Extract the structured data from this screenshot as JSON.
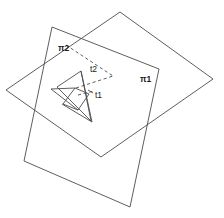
{
  "figure": {
    "background_color": "#ffffff",
    "stroke_color": "#4c4c4c",
    "label_color": "#1a1a1a",
    "width": 224,
    "height": 218,
    "labels": {
      "plane1": "π1",
      "plane2": "π2",
      "triangle1": "t1",
      "triangle2": "t2"
    },
    "label_positions": {
      "plane1": {
        "x": 142,
        "y": 79
      },
      "plane2": {
        "x": 58,
        "y": 48
      },
      "triangle1": {
        "x": 95,
        "y": 95
      },
      "triangle2": {
        "x": 92,
        "y": 70
      }
    },
    "shapes": {
      "plane1": {
        "name": "plane-pi1",
        "kind": "quadrilateral",
        "style": "solid",
        "points": "120,12 213,79 101,157 6,90"
      },
      "plane2": {
        "name": "plane-pi2",
        "kind": "quadrilateral",
        "style": "solid",
        "points": "52,27 159,69 130,207 24,161"
      },
      "triangle2": {
        "name": "triangle-t2",
        "kind": "triangle",
        "style": "solid",
        "points": "81,71 91,121 57,87"
      },
      "triangle1": {
        "name": "triangle-t1",
        "kind": "triangle",
        "style": "solid",
        "points": "75,88 89,94 71,106"
      },
      "triangle1_base_quad": {
        "name": "triangle-t1-base",
        "kind": "quadrilateral",
        "style": "solid",
        "points": "75,88 89,94 78,110 63,104"
      },
      "intersection_line": {
        "name": "plane-intersection-line",
        "style": "dashed",
        "x1": 66,
        "y1": 45,
        "x2": 113,
        "y2": 76
      },
      "t2_hidden_edge": {
        "name": "t2-hidden-edge",
        "style": "dashed",
        "x1": 76,
        "y1": 88,
        "x2": 112,
        "y2": 77
      },
      "t1_hidden_edge": {
        "name": "t1-hidden-edge",
        "style": "dashed",
        "x1": 78,
        "y1": 94,
        "x2": 93,
        "y2": 92
      }
    }
  }
}
